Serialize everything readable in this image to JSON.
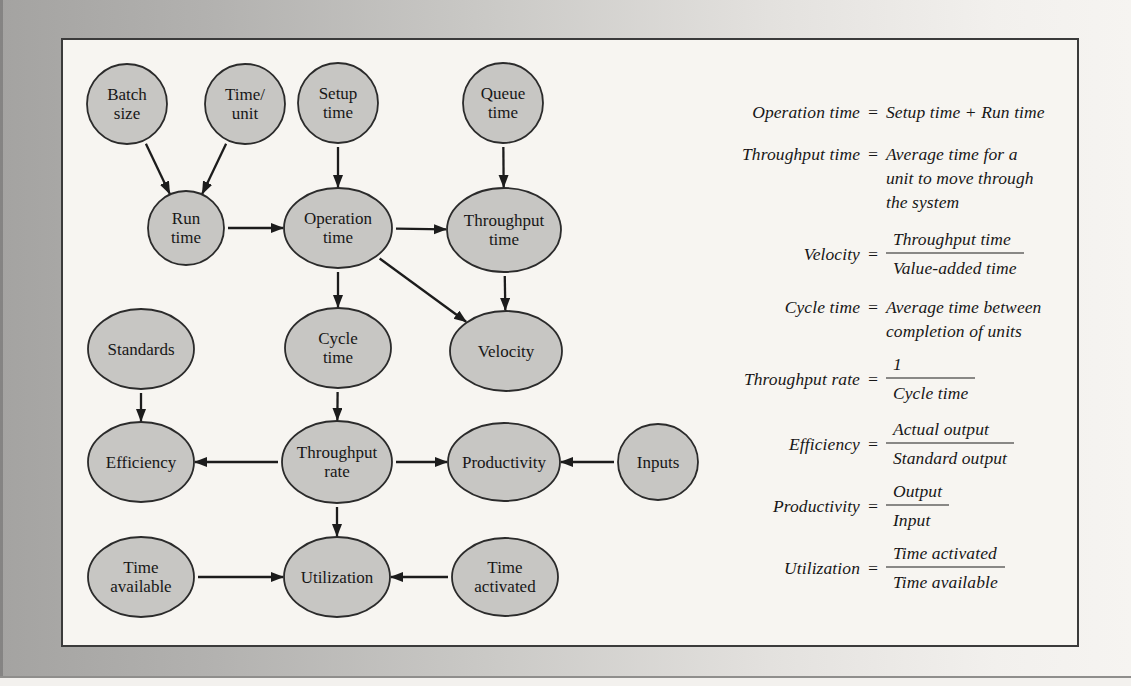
{
  "ui": {
    "equals": "="
  },
  "styles": {
    "surround_gradient_left": "#a4a3a1",
    "surround_gradient_right": "#f6f4f1",
    "box_fill": "#f7f5f1",
    "box_border": "#3b3b3b",
    "node_fill": "#c7c6c3",
    "node_stroke": "#2b2b2b",
    "arrow_color": "#1c1c1c",
    "text_color": "#171717"
  },
  "diagram": {
    "nodes": [
      {
        "id": "batch-size",
        "label": "Batch\nsize",
        "cx": 127,
        "cy": 104,
        "rx": 40,
        "ry": 40
      },
      {
        "id": "time-per-unit",
        "label": "Time/\nunit",
        "cx": 245,
        "cy": 104,
        "rx": 40,
        "ry": 40
      },
      {
        "id": "setup-time",
        "label": "Setup\ntime",
        "cx": 338,
        "cy": 103,
        "rx": 40,
        "ry": 40
      },
      {
        "id": "queue-time",
        "label": "Queue\ntime",
        "cx": 503,
        "cy": 103,
        "rx": 40,
        "ry": 40
      },
      {
        "id": "run-time",
        "label": "Run\ntime",
        "cx": 186,
        "cy": 228,
        "rx": 38,
        "ry": 37
      },
      {
        "id": "operation-time",
        "label": "Operation\ntime",
        "cx": 338,
        "cy": 228,
        "rx": 54,
        "ry": 40
      },
      {
        "id": "throughput-time",
        "label": "Throughput\ntime",
        "cx": 504,
        "cy": 230,
        "rx": 57,
        "ry": 42
      },
      {
        "id": "standards",
        "label": "Standards",
        "cx": 141,
        "cy": 349,
        "rx": 53,
        "ry": 40
      },
      {
        "id": "cycle-time",
        "label": "Cycle\ntime",
        "cx": 338,
        "cy": 348,
        "rx": 53,
        "ry": 40
      },
      {
        "id": "velocity",
        "label": "Velocity",
        "cx": 506,
        "cy": 351,
        "rx": 56,
        "ry": 40
      },
      {
        "id": "efficiency",
        "label": "Efficiency",
        "cx": 141,
        "cy": 462,
        "rx": 53,
        "ry": 40
      },
      {
        "id": "throughput-rate",
        "label": "Throughput\nrate",
        "cx": 337,
        "cy": 462,
        "rx": 55,
        "ry": 41
      },
      {
        "id": "productivity",
        "label": "Productivity",
        "cx": 504,
        "cy": 462,
        "rx": 56,
        "ry": 39
      },
      {
        "id": "inputs",
        "label": "Inputs",
        "cx": 658,
        "cy": 462,
        "rx": 40,
        "ry": 38
      },
      {
        "id": "time-available",
        "label": "Time\navailable",
        "cx": 141,
        "cy": 577,
        "rx": 53,
        "ry": 40
      },
      {
        "id": "utilization",
        "label": "Utilization",
        "cx": 337,
        "cy": 577,
        "rx": 53,
        "ry": 40
      },
      {
        "id": "time-activated",
        "label": "Time\nactivated",
        "cx": 505,
        "cy": 577,
        "rx": 53,
        "ry": 39
      }
    ],
    "edges": [
      {
        "from": "batch-size",
        "to": "run-time"
      },
      {
        "from": "time-per-unit",
        "to": "run-time"
      },
      {
        "from": "setup-time",
        "to": "operation-time"
      },
      {
        "from": "queue-time",
        "to": "throughput-time"
      },
      {
        "from": "run-time",
        "to": "operation-time"
      },
      {
        "from": "operation-time",
        "to": "throughput-time"
      },
      {
        "from": "operation-time",
        "to": "cycle-time"
      },
      {
        "from": "operation-time",
        "to": "velocity"
      },
      {
        "from": "throughput-time",
        "to": "velocity"
      },
      {
        "from": "standards",
        "to": "efficiency"
      },
      {
        "from": "cycle-time",
        "to": "throughput-rate"
      },
      {
        "from": "throughput-rate",
        "to": "efficiency"
      },
      {
        "from": "throughput-rate",
        "to": "productivity"
      },
      {
        "from": "inputs",
        "to": "productivity"
      },
      {
        "from": "throughput-rate",
        "to": "utilization"
      },
      {
        "from": "time-available",
        "to": "utilization"
      },
      {
        "from": "time-activated",
        "to": "utilization"
      }
    ]
  },
  "formulas": [
    {
      "lhs": "Operation time",
      "rhs": "Setup time + Run time"
    },
    {
      "lhs": "Throughput time",
      "lines": [
        "Average time for a",
        "unit to move through",
        "the system"
      ]
    },
    {
      "lhs": "Velocity",
      "frac": {
        "num": "Throughput time",
        "den": "Value-added time"
      }
    },
    {
      "lhs": "Cycle time",
      "lines": [
        "Average time between",
        "completion of units"
      ]
    },
    {
      "lhs": "Throughput rate",
      "frac": {
        "num": "1",
        "den": "Cycle time"
      }
    },
    {
      "lhs": "Efficiency",
      "frac": {
        "num": "Actual output",
        "den": "Standard output"
      }
    },
    {
      "lhs": "Productivity",
      "frac": {
        "num": "Output",
        "den": "Input"
      }
    },
    {
      "lhs": "Utilization",
      "frac": {
        "num": "Time activated",
        "den": "Time available"
      }
    }
  ]
}
